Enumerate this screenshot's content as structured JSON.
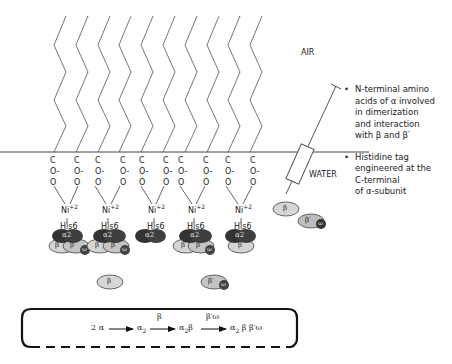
{
  "labels": {
    "air": "AIR",
    "water": "WATER"
  },
  "notes": [
    {
      "bullet": "•",
      "lines": [
        "N-terminal amino",
        "acids of α involved",
        "in dimerization",
        "and interaction",
        "with β and β′"
      ]
    },
    {
      "bullet": "•",
      "lines": [
        "Histidine tag",
        "engineered at the",
        "C-terminal",
        "of α-subunit"
      ]
    }
  ],
  "headgroup": {
    "c": "C",
    "o_minus": "O-",
    "o": "O",
    "ni": "Ni",
    "ni_charge": "+2",
    "his": "His6"
  },
  "subunits": {
    "alpha2": "α2",
    "beta": "β",
    "beta_prime": "β′",
    "omega": "ω"
  },
  "reaction": {
    "start": "2 α",
    "step1_product": "α",
    "step1_sub": "2",
    "step2_label": "β",
    "step2_product_a": "α",
    "step2_product_sub": "2",
    "step2_product_b": "β",
    "step3_label": "β′ω",
    "final_a": "α",
    "final_sub": "2",
    "final_b": "β β′ω"
  },
  "colors": {
    "line": "#555555",
    "alpha_dark": "#3a3a3a",
    "beta_light": "#d6d6d6",
    "beta_mid": "#bdbdbd",
    "omega_dark": "#444444"
  }
}
